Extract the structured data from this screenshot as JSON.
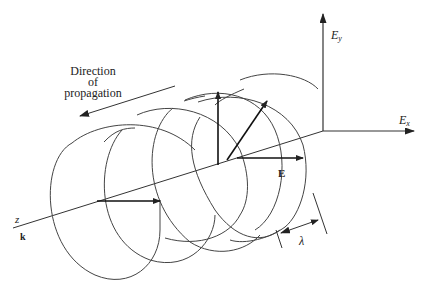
{
  "diagram": {
    "type": "circularly polarized electromagnetic wave",
    "labels": {
      "direction_line1": "Direction",
      "direction_line2": "of",
      "direction_line3": "propagation",
      "ey_main": "E",
      "ey_sub": "y",
      "ex_main": "E",
      "ex_sub": "x",
      "e_vector": "E",
      "z_axis": "z",
      "k_vector": "k",
      "wavelength": "λ"
    },
    "colors": {
      "stroke": "#333333",
      "background": "#ffffff"
    }
  }
}
